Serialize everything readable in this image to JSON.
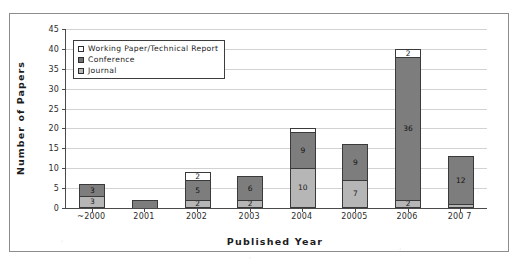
{
  "chart_data": {
    "type": "bar",
    "subtype": "stacked-column",
    "title": "",
    "xlabel": "Published Year",
    "ylabel": "Number of Papers",
    "ylim": [
      0,
      45
    ],
    "ytick_step": 5,
    "yticks": [
      45,
      40,
      35,
      30,
      25,
      20,
      15,
      10,
      5,
      0
    ],
    "grid": true,
    "grid_axis": "y",
    "legend_position": "top-left-inside",
    "categories": [
      "~2000",
      "2001",
      "2002",
      "2003",
      "2004",
      "20005",
      "2006",
      "200 7"
    ],
    "series": [
      {
        "name": "Working Paper/Technical Report",
        "color": "#ffffff",
        "values": [
          0,
          0,
          2,
          0,
          1,
          0,
          2,
          0
        ],
        "labels": [
          "",
          "",
          "2",
          "",
          "",
          "",
          "2",
          ""
        ]
      },
      {
        "name": "Conference",
        "color": "#7d7d7d",
        "values": [
          3,
          2,
          5,
          6,
          9,
          9,
          36,
          12
        ],
        "labels": [
          "3",
          "",
          "5",
          "6",
          "9",
          "9",
          "36",
          "12"
        ]
      },
      {
        "name": "Journal",
        "color": "#b6b6b6",
        "values": [
          3,
          0,
          2,
          2,
          10,
          7,
          2,
          1
        ],
        "labels": [
          "3",
          "",
          "2",
          "2",
          "10",
          "7",
          "2",
          ""
        ]
      }
    ],
    "totals": [
      6,
      2,
      9,
      8,
      20,
      16,
      40,
      13
    ]
  },
  "legend": {
    "items": [
      {
        "label": "Working Paper/Technical Report",
        "swatch": "white-square-icon"
      },
      {
        "label": "Conference",
        "swatch": "dark-gray-square-icon"
      },
      {
        "label": "Journal",
        "swatch": "light-gray-square-icon"
      }
    ]
  },
  "axes": {
    "y_title": "Number of Papers",
    "x_title": "Published Year"
  }
}
